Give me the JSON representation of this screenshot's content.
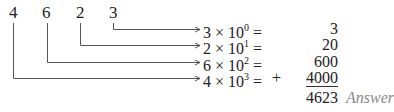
{
  "digits": [
    {
      "char": "4",
      "x": 9
    },
    {
      "char": "6",
      "x": 42
    },
    {
      "char": "2",
      "x": 76
    },
    {
      "char": "3",
      "x": 109
    }
  ],
  "rows": [
    {
      "coef": "3",
      "times": "×",
      "base": "10",
      "exp": "0",
      "eq": "=",
      "prefix": "",
      "value": "3"
    },
    {
      "coef": "2",
      "times": "×",
      "base": "10",
      "exp": "1",
      "eq": "=",
      "prefix": "",
      "value": "20"
    },
    {
      "coef": "6",
      "times": "×",
      "base": "10",
      "exp": "2",
      "eq": "=",
      "prefix": "",
      "value": "600"
    },
    {
      "coef": "4",
      "times": "×",
      "base": "10",
      "exp": "3",
      "eq": "=",
      "prefix": "+",
      "value": "4000"
    }
  ],
  "total": "4623",
  "answer_label": "Answer",
  "colors": {
    "text": "#222222",
    "lines": "#555555",
    "answer": "#888888"
  }
}
